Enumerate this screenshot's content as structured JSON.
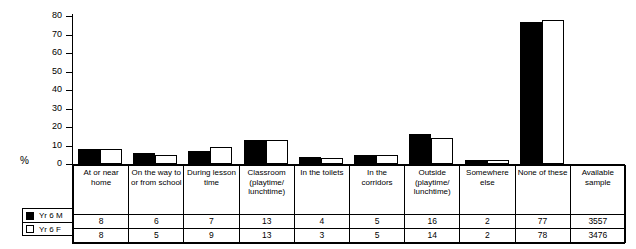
{
  "axis": {
    "ylabel": "%",
    "ticks": [
      0,
      10,
      20,
      30,
      40,
      50,
      60,
      70,
      80
    ]
  },
  "legend": {
    "items": [
      {
        "label": "Yr 6 M",
        "swatch": "filled-square-icon",
        "color": "#000000"
      },
      {
        "label": "Yr 6 F",
        "swatch": "hollow-square-icon",
        "color": "#ffffff"
      }
    ]
  },
  "table": {
    "headers": [
      "At or near home",
      "On the way to or from school",
      "During lesson time",
      "Classroom (playtime/ lunchtime)",
      "In the toilets",
      "In the corridors",
      "Outside (playtime/ lunchtime)",
      "Somewhere else",
      "None of these",
      "Available sample"
    ],
    "rows": [
      {
        "label": "Yr 6 M",
        "values": [
          "8",
          "6",
          "7",
          "13",
          "4",
          "5",
          "16",
          "2",
          "77",
          "3557"
        ]
      },
      {
        "label": "Yr 6 F",
        "values": [
          "8",
          "5",
          "9",
          "13",
          "3",
          "5",
          "14",
          "2",
          "78",
          "3476"
        ]
      }
    ]
  },
  "chart_data": {
    "type": "bar",
    "title": "",
    "xlabel": "",
    "ylabel": "%",
    "ylim": [
      0,
      80
    ],
    "yticks": [
      0,
      10,
      20,
      30,
      40,
      50,
      60,
      70,
      80
    ],
    "grid": false,
    "legend_position": "bottom-left",
    "categories": [
      "At or near home",
      "On the way to or from school",
      "During lesson time",
      "Classroom (playtime/ lunchtime)",
      "In the toilets",
      "In the corridors",
      "Outside (playtime/ lunchtime)",
      "Somewhere else",
      "None of these"
    ],
    "series": [
      {
        "name": "Yr 6 M",
        "color": "#000000",
        "values": [
          8,
          6,
          7,
          13,
          4,
          5,
          16,
          2,
          77
        ]
      },
      {
        "name": "Yr 6 F",
        "color": "#ffffff",
        "values": [
          8,
          5,
          9,
          13,
          3,
          5,
          14,
          2,
          78
        ]
      }
    ],
    "available_sample": {
      "Yr 6 M": 3557,
      "Yr 6 F": 3476
    }
  }
}
